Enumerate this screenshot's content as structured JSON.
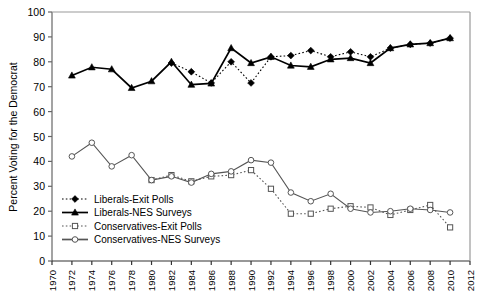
{
  "chart_data": {
    "type": "line",
    "title": "",
    "xlabel": "",
    "ylabel": "Percent Voting for the Democrat",
    "xlim": [
      1970,
      2012
    ],
    "ylim": [
      0,
      100
    ],
    "xticks": [
      1970,
      1972,
      1974,
      1976,
      1978,
      1980,
      1982,
      1984,
      1986,
      1988,
      1990,
      1992,
      1994,
      1996,
      1998,
      2000,
      2002,
      2004,
      2006,
      2008,
      2010,
      2012
    ],
    "yticks": [
      0,
      10,
      20,
      30,
      40,
      50,
      60,
      70,
      80,
      90,
      100
    ],
    "grid": false,
    "legend_position": "center-left",
    "series": [
      {
        "name": "Liberals-Exit Polls",
        "marker": "filled-diamond",
        "linestyle": "dotted",
        "color": "#000000",
        "points": [
          [
            1982,
            79.5
          ],
          [
            1984,
            76.0
          ],
          [
            1986,
            71.5
          ],
          [
            1988,
            80.0
          ],
          [
            1990,
            71.5
          ],
          [
            1992,
            82.0
          ],
          [
            1994,
            82.5
          ],
          [
            1996,
            84.5
          ],
          [
            1998,
            82.0
          ],
          [
            2000,
            84.0
          ],
          [
            2002,
            82.0
          ],
          [
            2004,
            85.5
          ],
          [
            2006,
            87.0
          ],
          [
            2008,
            87.5
          ],
          [
            2010,
            89.5
          ]
        ]
      },
      {
        "name": "Liberals-NES Surveys",
        "marker": "filled-triangle",
        "linestyle": "solid",
        "color": "#000000",
        "points": [
          [
            1972,
            74.5
          ],
          [
            1974,
            77.8
          ],
          [
            1976,
            77.0
          ],
          [
            1978,
            69.5
          ],
          [
            1980,
            72.2
          ],
          [
            1982,
            80.0
          ],
          [
            1984,
            70.8
          ],
          [
            1986,
            71.3
          ],
          [
            1988,
            85.5
          ],
          [
            1990,
            79.5
          ],
          [
            1992,
            82.0
          ],
          [
            1994,
            78.5
          ],
          [
            1996,
            78.0
          ],
          [
            1998,
            81.0
          ],
          [
            2000,
            81.5
          ],
          [
            2002,
            79.5
          ],
          [
            2004,
            85.5
          ],
          [
            2006,
            87.0
          ],
          [
            2008,
            87.5
          ],
          [
            2010,
            89.5
          ]
        ]
      },
      {
        "name": "Conservatives-Exit Polls",
        "marker": "open-square",
        "linestyle": "dotted",
        "color": "#555555",
        "points": [
          [
            1980,
            32.5
          ],
          [
            1982,
            34.5
          ],
          [
            1984,
            32.0
          ],
          [
            1986,
            34.0
          ],
          [
            1988,
            34.5
          ],
          [
            1990,
            36.5
          ],
          [
            1992,
            29.0
          ],
          [
            1994,
            19.0
          ],
          [
            1996,
            19.0
          ],
          [
            1998,
            21.0
          ],
          [
            2000,
            22.0
          ],
          [
            2002,
            21.5
          ],
          [
            2004,
            18.5
          ],
          [
            2006,
            20.5
          ],
          [
            2008,
            22.5
          ],
          [
            2010,
            13.5
          ]
        ]
      },
      {
        "name": "Conservatives-NES Surveys",
        "marker": "open-circle",
        "linestyle": "solid",
        "color": "#555555",
        "points": [
          [
            1972,
            42.0
          ],
          [
            1974,
            47.5
          ],
          [
            1976,
            38.0
          ],
          [
            1978,
            42.5
          ],
          [
            1980,
            32.5
          ],
          [
            1982,
            34.0
          ],
          [
            1984,
            31.5
          ],
          [
            1986,
            35.0
          ],
          [
            1988,
            36.0
          ],
          [
            1990,
            40.5
          ],
          [
            1992,
            39.5
          ],
          [
            1994,
            27.5
          ],
          [
            1996,
            24.0
          ],
          [
            1998,
            27.0
          ],
          [
            2000,
            21.0
          ],
          [
            2002,
            19.5
          ],
          [
            2004,
            20.0
          ],
          [
            2006,
            21.0
          ],
          [
            2008,
            20.5
          ],
          [
            2010,
            19.5
          ]
        ]
      }
    ]
  },
  "legend": {
    "items": [
      {
        "label": "Liberals-Exit Polls"
      },
      {
        "label": "Liberals-NES Surveys"
      },
      {
        "label": "Conservatives-Exit Polls"
      },
      {
        "label": "Conservatives-NES Surveys"
      }
    ]
  }
}
